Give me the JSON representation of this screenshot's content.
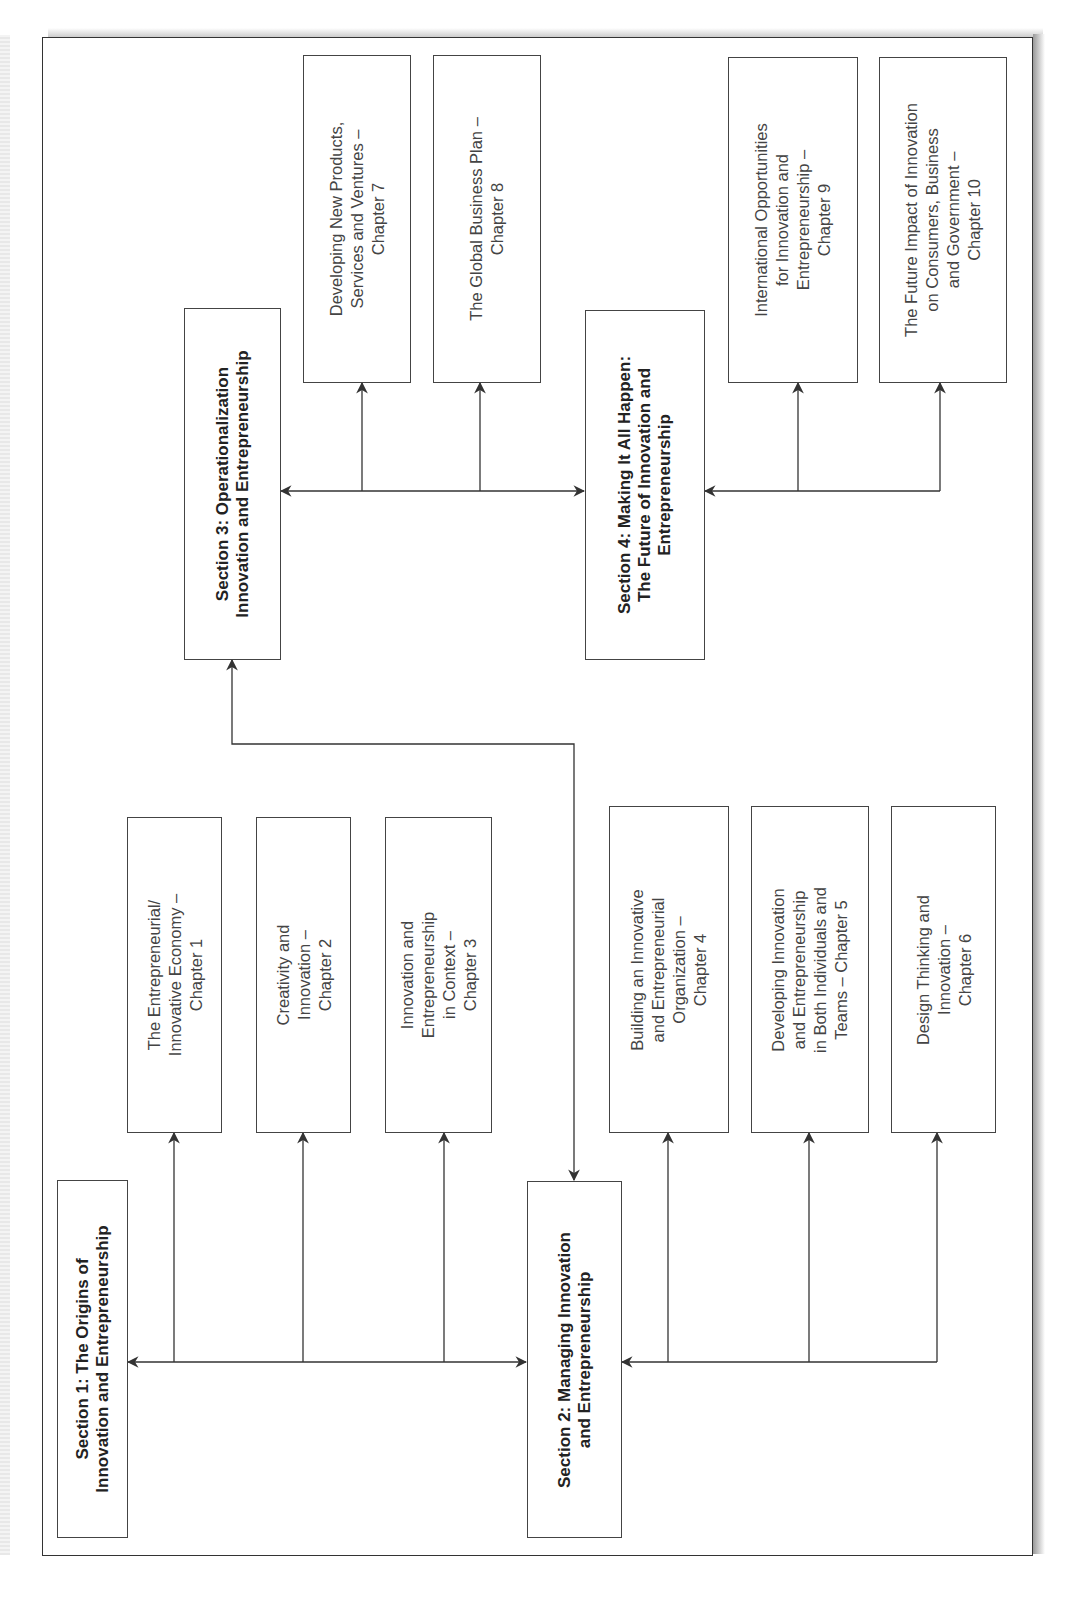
{
  "diagram": {
    "sections": [
      {
        "id": "s1",
        "label": "Section 1: The Origins of\nInnovation and Entrepreneurship"
      },
      {
        "id": "s2",
        "label": "Section 2: Managing Innovation\nand Entrepreneurship"
      },
      {
        "id": "s3",
        "label": "Section 3: Operationalization\nInnovation and Entrepreneurship"
      },
      {
        "id": "s4",
        "label": "Section 4: Making It All Happen:\nThe Future of Innovation and\nEntrepreneurship"
      }
    ],
    "chapters": [
      {
        "id": "c1",
        "section": "s1",
        "label": "The Entrepreneurial/\nInnovative Economy –\nChapter 1"
      },
      {
        "id": "c2",
        "section": "s1",
        "label": "Creativity and\nInnovation –\nChapter 2"
      },
      {
        "id": "c3",
        "section": "s1",
        "label": "Innovation and\nEntrepreneurship\nin Context –\nChapter 3"
      },
      {
        "id": "c4",
        "section": "s2",
        "label": "Building an Innovative\nand Entrepreneurial\nOrganization –\nChapter 4"
      },
      {
        "id": "c5",
        "section": "s2",
        "label": "Developing Innovation\nand Entrepreneurship\nin Both Individuals and\nTeams – Chapter 5"
      },
      {
        "id": "c6",
        "section": "s2",
        "label": "Design Thinking and\nInnovation –\nChapter 6"
      },
      {
        "id": "c7",
        "section": "s3",
        "label": "Developing New Products,\nServices and Ventures –\nChapter 7"
      },
      {
        "id": "c8",
        "section": "s3",
        "label": "The Global Business Plan –\nChapter 8"
      },
      {
        "id": "c9",
        "section": "s4",
        "label": "International Opportunities\nfor Innovation and\nEntrepreneurship –\nChapter 9"
      },
      {
        "id": "c10",
        "section": "s4",
        "label": "The Future Impact of Innovation\non Consumers, Business\nand Government –\nChapter 10"
      }
    ],
    "edges": [
      {
        "from": "s1",
        "to": "s2",
        "type": "bidirectional"
      },
      {
        "from": "s3",
        "to": "s4",
        "type": "bidirectional"
      },
      {
        "from": "s2",
        "to": "s3",
        "type": "bidirectional"
      },
      {
        "from": "s1",
        "to": "c1"
      },
      {
        "from": "s1",
        "to": "c2"
      },
      {
        "from": "s1",
        "to": "c3"
      },
      {
        "from": "s2",
        "to": "c4"
      },
      {
        "from": "s2",
        "to": "c5"
      },
      {
        "from": "s2",
        "to": "c6"
      },
      {
        "from": "s3",
        "to": "c7"
      },
      {
        "from": "s3",
        "to": "c8"
      },
      {
        "from": "s4",
        "to": "c9"
      },
      {
        "from": "s4",
        "to": "c10"
      }
    ],
    "colors": {
      "line": "#333333",
      "text": "#444444",
      "background": "#ffffff"
    }
  }
}
